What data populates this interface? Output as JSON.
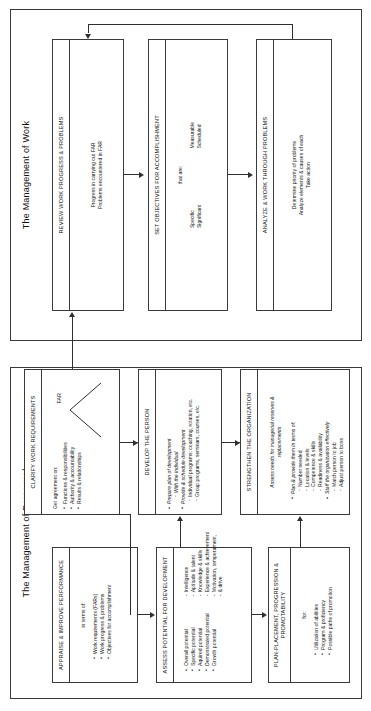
{
  "panels": {
    "personnel": {
      "title": "The Management of Personnel"
    },
    "work": {
      "title": "The Management of Work"
    }
  },
  "boxes": {
    "appraise": {
      "title": "APPRAISE & IMPROVE PERFORMANCE",
      "lead": "in terms of:",
      "bullets": [
        "Work requirements (FARs)",
        "Work progress & problems",
        "Objectives for accomplishment"
      ]
    },
    "assess": {
      "title": "ASSESS POTENTIAL FOR DEVELOPMENT",
      "bullets": [
        "Overall potential",
        "Specific potential",
        "Aquired potential",
        "Demonstrated potential",
        "Growth potential"
      ],
      "subs": [
        "Intelligence",
        "Aptitude & talent",
        "Knowledge & skills",
        "Experience & achievement",
        "Motivation, temperament,",
        "& drive"
      ]
    },
    "plan_placement": {
      "title": "PLAN-PLACEMENT, PROGRESSION & PROMOTABILITY",
      "lead": "for:",
      "bullets": [
        "Utilization of abilities",
        "Program & proficiency",
        "Possible paths of promotion"
      ]
    },
    "clarify": {
      "title": "CLARIFY WORK REQUIREMENTS",
      "lead": "Get agreement on:",
      "bullets": [
        "Functions & responsibilities",
        "Authority & accountability",
        "Results & relationships"
      ],
      "far_label": "FAR"
    },
    "develop": {
      "title": "DEVELOP THE PERSON",
      "bullets": [
        "Prepare plan of development",
        "Provide & schedule development"
      ],
      "sub_a": [
        "With the individual"
      ],
      "sub_b": [
        "Individual programs:  coaching, rotation, etc.",
        "Group programs, seminars, courses, etc."
      ]
    },
    "strengthen": {
      "title": "STRENGTHEN THE ORGANIZATION",
      "lead": "Assess needs for managerial reserves & replacements",
      "bullets": [
        "Plan & provide them in terms of:",
        "Staff the organization effectively"
      ],
      "sub_a": [
        "Number needed",
        "Location & levels",
        "Competence & skills",
        "Readiness & availability"
      ],
      "sub_b": [
        "Match person to job",
        "Adjust person to boss"
      ]
    },
    "review": {
      "title": "REVIEW WORK PROGRESS & PROBLEMS",
      "lines": [
        "Progress in carrying out FAR",
        "Problems encountered in FAR"
      ]
    },
    "objectives": {
      "title": "SET OBJECTIVES FOR ACCOMPLISHMENT",
      "lead": "that are:",
      "col1": [
        "Specific",
        "Significant"
      ],
      "col2": [
        "Measurable",
        "Scheduled"
      ]
    },
    "analyze": {
      "title": "ANALYZE & WORK THROUGH PROBLEMS",
      "lines": [
        "Determine priority of problems",
        "Analyze elements & causes of each",
        "Take action"
      ]
    }
  },
  "colors": {
    "stroke": "#3a3a3a",
    "arrow": "#2f2f2f",
    "background": "#ffffff",
    "text": "#111111"
  }
}
